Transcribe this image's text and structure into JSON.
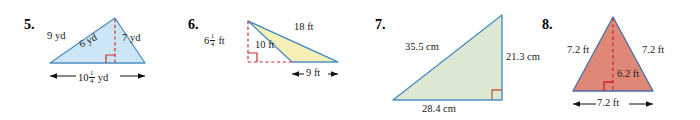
{
  "page": {
    "kind": "geometry-worksheet-exercises",
    "background": "#ffffff"
  },
  "colors": {
    "outline_blue": "#4a90c4",
    "fill_blue": "#cde6f5",
    "fill_yellow": "#f6f0b8",
    "fill_green": "#dde8d2",
    "fill_red": "#e08878",
    "dashed_red": "#d42a2a",
    "text": "#1a1a1a"
  },
  "problems": [
    {
      "number": "5.",
      "shape": "triangle",
      "fill": "#cde6f5",
      "unit": "yd",
      "labels": {
        "left_side": "9 yd",
        "right_side": "7 yd",
        "height": "6 yd",
        "base_whole": "10",
        "base_num": "1",
        "base_den": "4",
        "base_unit": "yd"
      }
    },
    {
      "number": "6.",
      "shape": "triangle",
      "fill": "#f6f0b8",
      "unit": "ft",
      "labels": {
        "height_whole": "6",
        "height_num": "1",
        "height_den": "4",
        "height_unit": "ft",
        "slant_left": "10 ft",
        "slant_top": "18 ft",
        "base": "9 ft"
      }
    },
    {
      "number": "7.",
      "shape": "right-triangle",
      "fill": "#dde8d2",
      "unit": "cm",
      "labels": {
        "hypotenuse": "35.5 cm",
        "vertical_side": "21.3 cm",
        "base": "28.4 cm"
      }
    },
    {
      "number": "8.",
      "shape": "isosceles-triangle",
      "fill": "#e08878",
      "unit": "ft",
      "labels": {
        "left_side": "7.2 ft",
        "right_side": "7.2 ft",
        "height": "6.2 ft",
        "base": "7.2 ft"
      }
    }
  ]
}
